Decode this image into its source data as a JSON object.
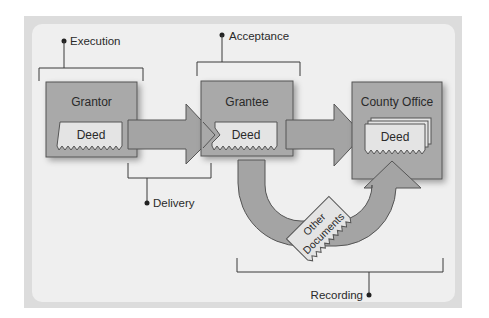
{
  "diagram": {
    "type": "process-flow",
    "labels": {
      "execution": "Execution",
      "acceptance": "Acceptance",
      "delivery": "Delivery",
      "recording": "Recording"
    },
    "parties": [
      {
        "name": "Grantor",
        "document": "Deed"
      },
      {
        "name": "Grantee",
        "document": "Deed"
      },
      {
        "name": "County Office",
        "document": "Deed"
      }
    ],
    "other_documents": {
      "line1": "Other",
      "line2": "Documents"
    },
    "colors": {
      "frame": "#dcdcdc",
      "panel": "#efefef",
      "box": "#a9a9a9",
      "arrow": "#a4a4a4",
      "deed": "#e4e4e4",
      "line": "#3a3a3a"
    }
  }
}
